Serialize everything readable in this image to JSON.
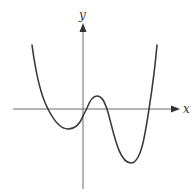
{
  "figure": {
    "axes": {
      "x_label": "x",
      "y_label": "y"
    },
    "colors": {
      "background": "#ffffff",
      "axis": "#6a6a6a",
      "curve": "#3a3a3a",
      "label": "#333333"
    },
    "curve": {
      "type": "quartic",
      "end_behavior": "both ends rise upward",
      "x_intercepts": 4,
      "features": [
        {
          "kind": "left-end",
          "position": "upper-left"
        },
        {
          "kind": "x-intercept",
          "position": "left of y-axis"
        },
        {
          "kind": "local-minimum",
          "position": "shallow, left of y-axis, below x-axis"
        },
        {
          "kind": "y-intercept",
          "position": "slightly below origin"
        },
        {
          "kind": "x-intercept",
          "position": "just right of origin"
        },
        {
          "kind": "local-maximum",
          "position": "small hump, right of y-axis, above x-axis"
        },
        {
          "kind": "x-intercept",
          "position": "right of local maximum"
        },
        {
          "kind": "local-minimum",
          "position": "deep, right of y-axis, well below x-axis"
        },
        {
          "kind": "x-intercept",
          "position": "far right"
        },
        {
          "kind": "right-end",
          "position": "upper-right"
        }
      ]
    }
  }
}
